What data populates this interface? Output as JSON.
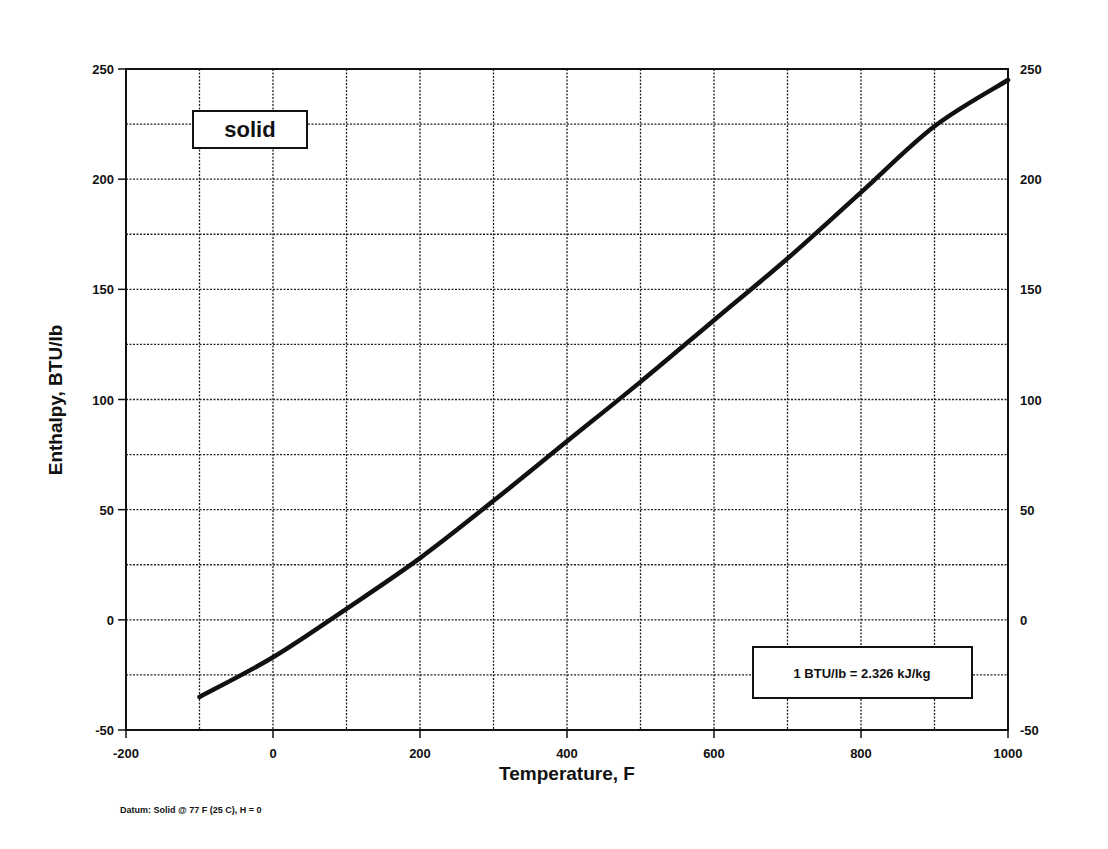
{
  "chart_data": {
    "type": "line",
    "title": "",
    "xlabel": "Temperature, F",
    "ylabel": "Enthalpy, BTU/lb",
    "xlim": [
      -200,
      1000
    ],
    "ylim": [
      -50,
      250
    ],
    "x_ticks": [
      -200,
      0,
      200,
      400,
      600,
      800,
      1000
    ],
    "x_minor_grid_step": 100,
    "y_ticks": [
      -50,
      0,
      50,
      100,
      150,
      200,
      250
    ],
    "y_minor_grid_step": 25,
    "y_ticks_right": [
      -50,
      0,
      50,
      100,
      150,
      200,
      250
    ],
    "grid": true,
    "legend": null,
    "series": [
      {
        "name": "solid",
        "x": [
          -100,
          0,
          100,
          200,
          300,
          400,
          500,
          600,
          700,
          800,
          900,
          1000
        ],
        "y": [
          -35,
          -17,
          5,
          28,
          54,
          81,
          108,
          136,
          164,
          194,
          224,
          245
        ]
      }
    ],
    "annotations": [
      {
        "id": "phase_label",
        "text": "solid",
        "position": "upper-left"
      },
      {
        "id": "conversion",
        "text": "1 BTU/lb = 2.326 kJ/kg",
        "position": "lower-right"
      },
      {
        "id": "datum",
        "text": "Datum: Solid @ 77 F (25 C),  H = 0",
        "position": "below-chart-left"
      }
    ]
  },
  "labels": {
    "phase": "solid",
    "conversion": "1 BTU/lb = 2.326 kJ/kg",
    "datum": "Datum: Solid @ 77 F (25 C),  H = 0",
    "xlabel": "Temperature, F",
    "ylabel": "Enthalpy, BTU/lb"
  },
  "colors": {
    "line": "#111111",
    "grid": "#222222",
    "background": "#ffffff"
  }
}
